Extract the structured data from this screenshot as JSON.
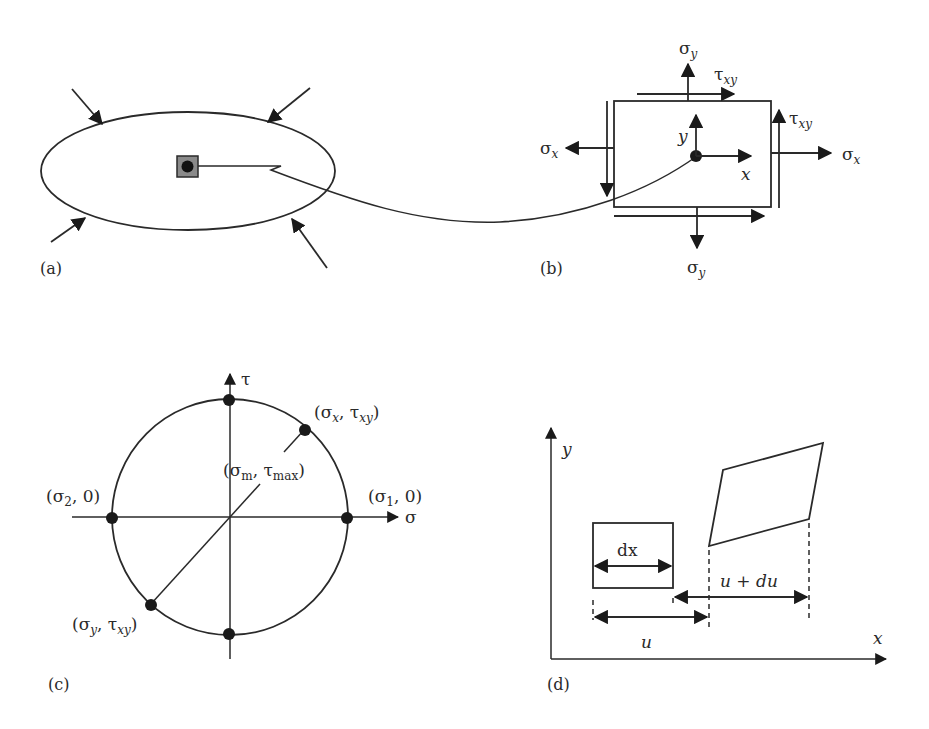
{
  "figure": {
    "panels": {
      "a": {
        "label": "(a)",
        "description": "Loaded body with small element"
      },
      "b": {
        "label": "(b)",
        "sigma_y_top": "σ",
        "sigma_y_top_sub": "y",
        "tau_xy_top": "τ",
        "tau_xy_top_sub": "xy",
        "tau_xy_right": "τ",
        "tau_xy_right_sub": "xy",
        "sigma_x_left": "σ",
        "sigma_x_left_sub": "x",
        "sigma_x_right": "σ",
        "sigma_x_right_sub": "x",
        "sigma_y_bottom": "σ",
        "sigma_y_bottom_sub": "y",
        "axis_x": "x",
        "axis_y": "y"
      },
      "c": {
        "label": "(c)",
        "axis_tau": "τ",
        "axis_sigma": "σ",
        "point_sx_txy": {
          "open": "(σ",
          "sub1": "x",
          "mid": ", τ",
          "sub2": "xy",
          "close": ")"
        },
        "point_sm_tmax": {
          "open": "(σ",
          "sub1": "m",
          "mid": ", τ",
          "sub2": "max",
          "close": ")"
        },
        "point_s2": {
          "open": "(σ",
          "sub1": "2",
          "close": ", 0)"
        },
        "point_s1": {
          "open": "(σ",
          "sub1": "1",
          "close": ", 0)"
        },
        "point_sy_txy": {
          "open": "(σ",
          "sub1": "y",
          "mid": ", τ",
          "sub2": "xy",
          "close": ")"
        }
      },
      "d": {
        "label": "(d)",
        "axis_x": "x",
        "axis_y": "y",
        "dx_label": "dx",
        "u_label": "u",
        "u_du_label": "u + du"
      }
    }
  }
}
